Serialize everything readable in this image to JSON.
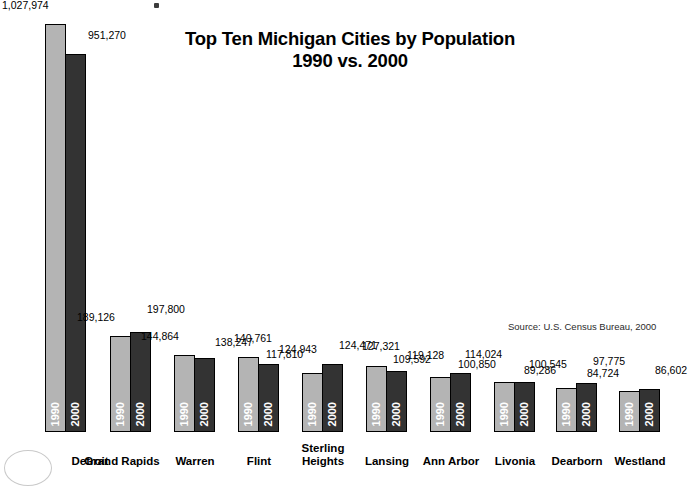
{
  "title": {
    "line1": "Top Ten Michigan Cities by Population",
    "line2": "1990 vs. 2000"
  },
  "source": "Source: U.S. Census Bureau, 2000",
  "series_labels": {
    "a": "1990",
    "b": "2000"
  },
  "colors": {
    "series_1990": "#b4b4b4",
    "series_2000": "#333333",
    "outline": "#000000",
    "background": "#ffffff",
    "text": "#000000"
  },
  "chart_data": {
    "type": "bar",
    "title": "Top Ten Michigan Cities by Population 1990 vs. 2000",
    "subtitle": "1990 vs. 2000",
    "xlabel": "",
    "ylabel": "",
    "grid": false,
    "legend": "in-bar vertical year labels",
    "ylim": [
      0,
      1027974
    ],
    "annotations": [
      "Source: U.S. Census Bureau, 2000"
    ],
    "categories": [
      "Detroit",
      "Grand Rapids",
      "Warren",
      "Flint",
      "Sterling Heights",
      "Lansing",
      "Ann Arbor",
      "Livonia",
      "Dearborn",
      "Westland"
    ],
    "series": [
      {
        "name": "1990",
        "values": [
          1027974,
          189126,
          144864,
          140761,
          117810,
          127321,
          109592,
          100850,
          89286,
          84724
        ],
        "labels": [
          "1,027,974",
          "189,126",
          "144,864",
          "140,761",
          "117,810",
          "127,321",
          "109,592",
          "100,850",
          "89,286",
          "84,724"
        ]
      },
      {
        "name": "2000",
        "values": [
          951270,
          197800,
          138247,
          124943,
          124471,
          119128,
          114024,
          100545,
          97775,
          86602
        ],
        "labels": [
          "951,270",
          "197,800",
          "138,247",
          "124,943",
          "124,471",
          "119,128",
          "114,024",
          "100,545",
          "97,775",
          "86,602"
        ]
      }
    ]
  },
  "groups": [
    {
      "city": "Detroit",
      "city_lines": [
        "Detroit"
      ],
      "left": 45,
      "v1990": "1,027,974",
      "v2000": "951,270",
      "h1990": 408,
      "h2000": 378,
      "lbl1990_dx": -43,
      "lbl1990_dy": -13,
      "lbl2000_dx": 22,
      "lbl2000_dy": -13,
      "cat_left": -15
    },
    {
      "city": "Grand Rapids",
      "city_lines": [
        "Grand Rapids"
      ],
      "left": 110,
      "v1990": "189,126",
      "v2000": "197,800",
      "h1990": 96,
      "h2000": 100,
      "lbl1990_dx": -33,
      "lbl1990_dy": -13,
      "lbl2000_dx": 16,
      "lbl2000_dy": -17,
      "cat_left": -48
    },
    {
      "city": "Warren",
      "city_lines": [
        "Warren"
      ],
      "left": 174,
      "v1990": "144,864",
      "v2000": "138,247",
      "h1990": 77,
      "h2000": 74,
      "lbl1990_dx": -33,
      "lbl1990_dy": -13,
      "lbl2000_dx": 20,
      "lbl2000_dy": -10,
      "cat_left": -39
    },
    {
      "city": "Flint",
      "city_lines": [
        "Flint"
      ],
      "left": 238,
      "v1990": "140,761",
      "v2000": "124,943",
      "h1990": 75,
      "h2000": 68,
      "lbl1990_dx": -4,
      "lbl1990_dy": -13,
      "lbl2000_dx": 20,
      "lbl2000_dy": -9,
      "cat_left": -39
    },
    {
      "city": "Sterling Heights",
      "city_lines": [
        "Sterling",
        "Heights"
      ],
      "left": 302,
      "v1990": "117,810",
      "v2000": "124,471",
      "h1990": 59,
      "h2000": 68,
      "lbl1990_dx": -36,
      "lbl1990_dy": -13,
      "lbl2000_dx": 16,
      "lbl2000_dy": -13,
      "cat_left": -39
    },
    {
      "city": "Lansing",
      "city_lines": [
        "Lansing"
      ],
      "left": 366,
      "v1990": "127,321",
      "v2000": "119,128",
      "h1990": 66,
      "h2000": 61,
      "lbl1990_dx": -4,
      "lbl1990_dy": -14,
      "lbl2000_dx": 20,
      "lbl2000_dy": -10,
      "cat_left": -39
    },
    {
      "city": "Ann Arbor",
      "city_lines": [
        "Ann Arbor"
      ],
      "left": 430,
      "v1990": "109,592",
      "v2000": "114,024",
      "h1990": 55,
      "h2000": 59,
      "lbl1990_dx": -37,
      "lbl1990_dy": -12,
      "lbl2000_dx": 14,
      "lbl2000_dy": -13,
      "cat_left": -39
    },
    {
      "city": "Livonia",
      "city_lines": [
        "Livonia"
      ],
      "left": 494,
      "v1990": "100,850",
      "v2000": "100,545",
      "h1990": 50,
      "h2000": 50,
      "lbl1990_dx": -36,
      "lbl1990_dy": -12,
      "lbl2000_dx": 14,
      "lbl2000_dy": -12,
      "cat_left": -39
    },
    {
      "city": "Dearborn",
      "city_lines": [
        "Dearborn"
      ],
      "left": 556,
      "v1990": "89,286",
      "v2000": "97,775",
      "h1990": 44,
      "h2000": 49,
      "lbl1990_dx": -32,
      "lbl1990_dy": -12,
      "lbl2000_dx": 16,
      "lbl2000_dy": -16,
      "cat_left": -39
    },
    {
      "city": "Westland",
      "city_lines": [
        "Westland"
      ],
      "left": 619,
      "v1990": "84,724",
      "v2000": "86,602",
      "h1990": 41,
      "h2000": 43,
      "lbl1990_dx": -32,
      "lbl1990_dy": -12,
      "lbl2000_dx": 15,
      "lbl2000_dy": -13,
      "cat_left": -39
    }
  ]
}
